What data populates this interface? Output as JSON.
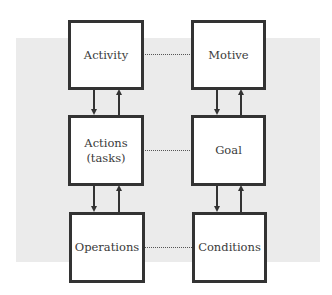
{
  "diagram": {
    "left_column": [
      {
        "id": "activity",
        "label": "Activity"
      },
      {
        "id": "actions",
        "label": "Actions\n(tasks)"
      },
      {
        "id": "operations",
        "label": "Operations"
      }
    ],
    "right_column": [
      {
        "id": "motive",
        "label": "Motive"
      },
      {
        "id": "goal",
        "label": "Goal"
      },
      {
        "id": "conditions",
        "label": "Conditions"
      }
    ],
    "horizontal_links": [
      {
        "from": "activity",
        "to": "motive",
        "style": "dotted"
      },
      {
        "from": "actions",
        "to": "goal",
        "style": "dotted"
      },
      {
        "from": "operations",
        "to": "conditions",
        "style": "dotted"
      }
    ],
    "vertical_links": [
      {
        "from": "activity",
        "to": "actions",
        "style": "bidirectional-arrows"
      },
      {
        "from": "actions",
        "to": "operations",
        "style": "bidirectional-arrows"
      },
      {
        "from": "motive",
        "to": "goal",
        "style": "bidirectional-arrows"
      },
      {
        "from": "goal",
        "to": "conditions",
        "style": "bidirectional-arrows"
      }
    ],
    "colors": {
      "background_panel": "#ebebeb",
      "box_fill": "#ffffff",
      "box_border": "#333333",
      "text": "#3a3a3a"
    }
  }
}
